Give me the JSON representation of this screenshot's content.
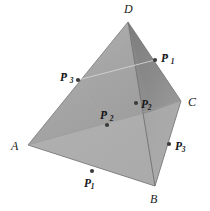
{
  "figure": {
    "type": "geometric-diagram",
    "background_color": "#ffffff",
    "canvas": {
      "width": 210,
      "height": 211
    }
  },
  "solid": {
    "name": "tetrahedron",
    "vertices": [
      {
        "id": "D",
        "label": "D",
        "x": 128,
        "y": 22
      },
      {
        "id": "A",
        "label": "A",
        "x": 28,
        "y": 145
      },
      {
        "id": "B",
        "label": "B",
        "x": 155,
        "y": 186
      },
      {
        "id": "C",
        "label": "C",
        "x": 181,
        "y": 101
      }
    ],
    "faces": [
      {
        "id": "ABD",
        "name": "left-face",
        "fill": "#a9a9a9"
      },
      {
        "id": "DBC",
        "name": "right-face",
        "fill": "#8d8d8d"
      },
      {
        "id": "ABC",
        "name": "bottom-face",
        "fill": "#b4b4b4"
      }
    ],
    "edge_color": "#7a7a7a",
    "section_line_color": "#cfcfcf"
  },
  "vertex_labels": [
    {
      "key": "D",
      "text": "D",
      "x": 124,
      "y": 3
    },
    {
      "key": "A",
      "text": "A",
      "x": 11,
      "y": 140
    },
    {
      "key": "B",
      "text": "B",
      "x": 150,
      "y": 193
    },
    {
      "key": "C",
      "text": "C",
      "x": 188,
      "y": 96
    }
  ],
  "points": [
    {
      "key": "P1",
      "base": "P",
      "sub": "1",
      "prime": "",
      "dot": {
        "x": 92,
        "y": 171
      },
      "label": {
        "x": 84,
        "y": 178
      }
    },
    {
      "key": "P2",
      "base": "P",
      "sub": "2",
      "prime": "",
      "dot": {
        "x": 136,
        "y": 103
      },
      "label": {
        "x": 141,
        "y": 99
      }
    },
    {
      "key": "P3",
      "base": "P",
      "sub": "3",
      "prime": "",
      "dot": {
        "x": 169,
        "y": 144
      },
      "label": {
        "x": 175,
        "y": 141
      }
    },
    {
      "key": "P1p",
      "base": "P",
      "sub": "1",
      "prime": "′",
      "dot": {
        "x": 155,
        "y": 60
      },
      "label": {
        "x": 161,
        "y": 53
      }
    },
    {
      "key": "P2p",
      "base": "P",
      "sub": "2",
      "prime": "′",
      "dot": {
        "x": 107,
        "y": 125
      },
      "label": {
        "x": 100,
        "y": 110
      }
    },
    {
      "key": "P3p",
      "base": "P",
      "sub": "3",
      "prime": "′",
      "dot": {
        "x": 78,
        "y": 80
      },
      "label": {
        "x": 60,
        "y": 72
      }
    }
  ],
  "point_marker": {
    "color": "#3b3b3b",
    "radius": 2.1
  }
}
